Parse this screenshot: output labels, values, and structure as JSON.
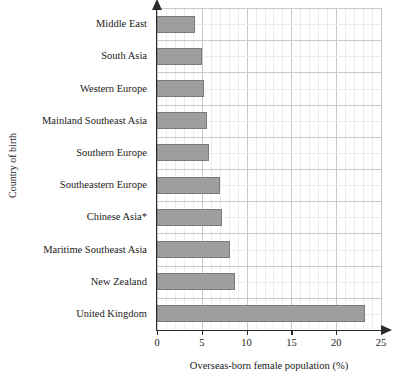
{
  "chart_data": {
    "type": "bar",
    "orientation": "horizontal",
    "title": "",
    "xlabel": "Overseas-born female population (%)",
    "ylabel": "Country of birth",
    "categories": [
      "Middle East",
      "South Asia",
      "Western Europe",
      "Mainland Southeast Asia",
      "Southern Europe",
      "Southeastern Europe",
      "Chinese Asia*",
      "Maritime Southeast Asia",
      "New Zealand",
      "United Kingdom"
    ],
    "values": [
      4.2,
      5.0,
      5.3,
      5.6,
      5.8,
      7.0,
      7.2,
      8.1,
      8.7,
      23.2
    ],
    "xlim": [
      0,
      25
    ],
    "xticks": [
      0,
      5,
      10,
      15,
      20,
      25
    ],
    "xtick_labels": [
      "0",
      "5",
      "10",
      "15",
      "20",
      "25"
    ],
    "x_minor_tick_step": 1,
    "grid": true,
    "grid_axes": "both",
    "legend": null,
    "bar_color": "#9e9e9e",
    "bar_edge_color": "#7a7a7a",
    "grid_major_color": "#c9c9c9",
    "grid_minor_color": "#ececec",
    "axis_color": "#2a2a2a",
    "footnote": "*"
  }
}
